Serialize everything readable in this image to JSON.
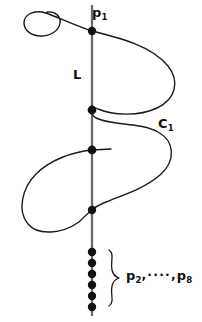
{
  "figure": {
    "background_color": "#ffffff",
    "ink_color": "#111111",
    "line_color": "#555555",
    "width": 202,
    "height": 322
  },
  "labels": {
    "p1": "p",
    "p1_sub": "1",
    "L": "L",
    "C1": "C",
    "C1_sub": "1",
    "p2": "p",
    "p2_sub": "2",
    "separator": ",····,",
    "p8": "p",
    "p8_sub": "8"
  },
  "geometry": {
    "line": {
      "name": "L",
      "x": 92,
      "y_top": 5,
      "y_bottom": 316,
      "stroke_width": 2.2,
      "color": "#666666"
    },
    "curve": {
      "name": "C1",
      "stroke_width": 1.4,
      "color": "#1a1a1a"
    },
    "intersection_points": [
      {
        "label": "p1",
        "x": 92,
        "y": 31,
        "radius": 4.2
      },
      {
        "label": "p2",
        "x": 92,
        "y": 110,
        "radius": 4.2
      },
      {
        "label": "p3",
        "x": 92,
        "y": 150,
        "radius": 4.2
      },
      {
        "label": "p4",
        "x": 92,
        "y": 210,
        "radius": 4.2
      },
      {
        "label": "p5",
        "x": 92,
        "y": 252,
        "radius": 4.2
      },
      {
        "label": "p6",
        "x": 92,
        "y": 263,
        "radius": 4.2
      },
      {
        "label": "p7",
        "x": 92,
        "y": 274,
        "radius": 4.2
      },
      {
        "label": "p8",
        "x": 92,
        "y": 285,
        "radius": 4.2
      },
      {
        "label": "p9",
        "x": 92,
        "y": 296,
        "radius": 4.2
      },
      {
        "label": "p10",
        "x": 92,
        "y": 307,
        "radius": 4.2
      }
    ],
    "brace": {
      "x": 112,
      "y_top": 250,
      "y_bottom": 306,
      "tip_x": 120,
      "tip_y": 278
    }
  }
}
